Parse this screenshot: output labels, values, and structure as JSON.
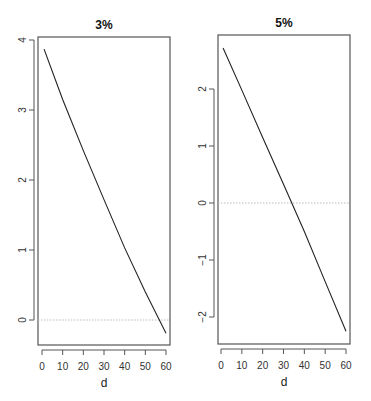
{
  "chart_data": [
    {
      "type": "line",
      "title": "3%",
      "xlabel": "d",
      "ylabel": "",
      "x_ticks": [
        0,
        10,
        20,
        30,
        40,
        50,
        60
      ],
      "y_ticks": [
        0,
        1,
        2,
        3,
        4
      ],
      "xlim": [
        -2,
        62
      ],
      "ylim": [
        -0.35,
        4.05
      ],
      "reference_line": {
        "y": 0,
        "style": "dotted",
        "color": "#bbbbbb"
      },
      "series": [
        {
          "name": "curve",
          "x": [
            1,
            10,
            20,
            30,
            40,
            50,
            60
          ],
          "y": [
            3.87,
            3.15,
            2.42,
            1.72,
            1.03,
            0.4,
            -0.19
          ]
        }
      ]
    },
    {
      "type": "line",
      "title": "5%",
      "xlabel": "d",
      "ylabel": "",
      "x_ticks": [
        0,
        10,
        20,
        30,
        40,
        50,
        60
      ],
      "y_ticks": [
        -2,
        -1,
        0,
        1,
        2
      ],
      "xlim": [
        -2,
        62
      ],
      "ylim": [
        -2.4,
        2.9
      ],
      "reference_line": {
        "y": 0,
        "style": "dotted",
        "color": "#bbbbbb"
      },
      "series": [
        {
          "name": "curve",
          "x": [
            1,
            10,
            20,
            30,
            40,
            50,
            60
          ],
          "y": [
            2.72,
            1.98,
            1.15,
            0.33,
            -0.5,
            -1.38,
            -2.25
          ]
        }
      ]
    }
  ]
}
